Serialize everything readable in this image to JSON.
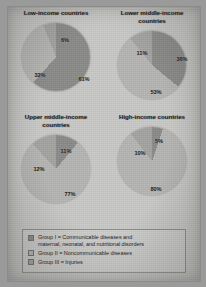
{
  "figure": {
    "panels": [
      {
        "title": "Low-income countries",
        "title_lines": [
          "Low-income countries"
        ],
        "labels": [
          {
            "text": "61%",
            "x": 62,
            "y": 56
          },
          {
            "text": "32%",
            "x": 18,
            "y": 52
          },
          {
            "text": "6%",
            "x": 43,
            "y": 17
          }
        ]
      },
      {
        "title": "Lower middle-income countries",
        "title_lines": [
          "Lower middle-income",
          "countries"
        ],
        "labels": [
          {
            "text": "36%",
            "x": 64,
            "y": 28
          },
          {
            "text": "53%",
            "x": 38,
            "y": 61
          },
          {
            "text": "11%",
            "x": 24,
            "y": 22
          }
        ]
      },
      {
        "title": "Upper middle-income countries",
        "title_lines": [
          "Upper middle-income",
          "countries"
        ],
        "labels": [
          {
            "text": "11%",
            "x": 44,
            "y": 16
          },
          {
            "text": "77%",
            "x": 48,
            "y": 59
          },
          {
            "text": "12%",
            "x": 17,
            "y": 34
          }
        ]
      },
      {
        "title": "High-income countries",
        "title_lines": [
          "High-income countries"
        ],
        "labels": [
          {
            "text": "5%",
            "x": 41,
            "y": 14
          },
          {
            "text": "80%",
            "x": 38,
            "y": 62
          },
          {
            "text": "10%",
            "x": 22,
            "y": 26
          }
        ]
      }
    ],
    "legend": {
      "items": [
        {
          "color": "#8a8a88",
          "lines": [
            "Group I = Communicable diseases and",
            "maternal, neonatal, and nutritional disorders"
          ]
        },
        {
          "color": "#b5b5b3",
          "lines": [
            "Group II = Noncommunicable diseases"
          ]
        },
        {
          "color": "#a3a3a1",
          "lines": [
            "Group III = Injuries"
          ]
        }
      ]
    }
  },
  "chart_data": {
    "type": "pie",
    "series_names": [
      "Group I = Communicable diseases and maternal, neonatal, and nutritional disorders",
      "Group II = Noncommunicable diseases",
      "Group III = Injuries"
    ],
    "units": "percent",
    "legend_position": "bottom",
    "charts": [
      {
        "title": "Low-income countries",
        "categories": [
          "Group I",
          "Group II",
          "Group III"
        ],
        "values": [
          61,
          32,
          6
        ],
        "colors": [
          "#8a8a88",
          "#b5b5b3",
          "#a3a3a1"
        ]
      },
      {
        "title": "Lower middle-income countries",
        "categories": [
          "Group I",
          "Group II",
          "Group III"
        ],
        "values": [
          36,
          53,
          11
        ],
        "colors": [
          "#8a8a88",
          "#b5b5b3",
          "#a3a3a1"
        ]
      },
      {
        "title": "Upper middle-income countries",
        "categories": [
          "Group I",
          "Group II",
          "Group III"
        ],
        "values": [
          11,
          77,
          12
        ],
        "colors": [
          "#8a8a88",
          "#b5b5b3",
          "#a3a3a1"
        ]
      },
      {
        "title": "High-income countries",
        "categories": [
          "Group I",
          "Group II",
          "Group III"
        ],
        "values": [
          5,
          80,
          10
        ],
        "colors": [
          "#8a8a88",
          "#b5b5b3",
          "#a3a3a1"
        ]
      }
    ]
  }
}
